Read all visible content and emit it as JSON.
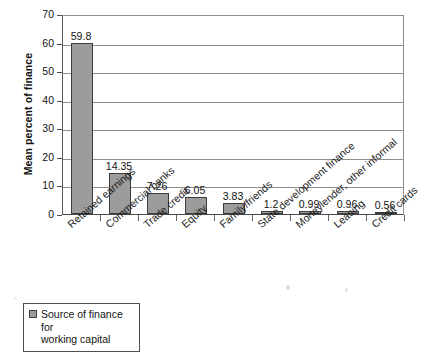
{
  "chart_data": {
    "type": "bar",
    "title": "",
    "xlabel": "",
    "ylabel": "Mean percent of finance",
    "ylim": [
      0,
      70
    ],
    "yticks": [
      0,
      10,
      20,
      30,
      40,
      50,
      60,
      70
    ],
    "grid": true,
    "legend_position": "bottom-left",
    "legend": [
      "Source of finance for working capital"
    ],
    "categories": [
      "Retained earnings",
      "Commercial banks",
      "Trade credit",
      "Equity",
      "Family/friends",
      "State development finance",
      "Moneylender, other informal",
      "Leasing",
      "Credit cards"
    ],
    "values": [
      59.8,
      14.35,
      7.26,
      6.05,
      3.83,
      1.2,
      0.99,
      0.96,
      0.56
    ],
    "value_labels": [
      "59.8",
      "14.35",
      "7.26",
      "6.05",
      "3.83",
      "1.2",
      "0.99",
      "0.96",
      "0.56"
    ],
    "series": [
      {
        "name": "Source of finance for working capital",
        "values": [
          59.8,
          14.35,
          7.26,
          6.05,
          3.83,
          1.2,
          0.99,
          0.96,
          0.56
        ]
      }
    ],
    "colors": {
      "bar_fill": "#9c9c9c",
      "bar_border": "#3c3c3c",
      "gridline": "#8e8e8e",
      "axis": "#4a4a4a",
      "background": "#ffffff",
      "text": "#121212"
    }
  },
  "legend": {
    "label_line1": "Source of finance for",
    "label_line2": "working capital"
  }
}
